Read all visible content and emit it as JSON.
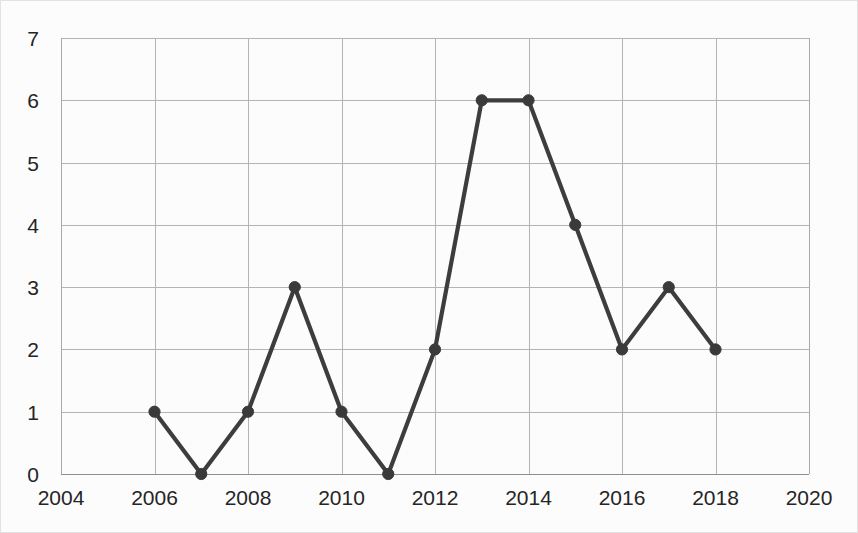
{
  "chart_data": {
    "type": "line",
    "title": "",
    "subtitle": "",
    "xlabel": "",
    "ylabel": "",
    "x": [
      2006,
      2007,
      2008,
      2009,
      2010,
      2011,
      2012,
      2013,
      2014,
      2015,
      2016,
      2017,
      2018
    ],
    "values": [
      1,
      0,
      1,
      3,
      1,
      0,
      2,
      6,
      6,
      4,
      2,
      3,
      2
    ],
    "series": [
      {
        "name": "",
        "x": [
          2006,
          2007,
          2008,
          2009,
          2010,
          2011,
          2012,
          2013,
          2014,
          2015,
          2016,
          2017,
          2018
        ],
        "values": [
          1,
          0,
          1,
          3,
          1,
          0,
          2,
          6,
          6,
          4,
          2,
          3,
          2
        ]
      }
    ],
    "xlim": [
      2004,
      2020
    ],
    "ylim": [
      0,
      7
    ],
    "x_tick_labels": [
      "2004",
      "2006",
      "2008",
      "2010",
      "2012",
      "2014",
      "2016",
      "2018",
      "2020"
    ],
    "x_tick_values": [
      2004,
      2006,
      2008,
      2010,
      2012,
      2014,
      2016,
      2018,
      2020
    ],
    "y_tick_labels": [
      "0",
      "1",
      "2",
      "3",
      "4",
      "5",
      "6",
      "7"
    ],
    "y_tick_values": [
      0,
      1,
      2,
      3,
      4,
      5,
      6,
      7
    ],
    "grid": true,
    "grid_x": true,
    "grid_y": true,
    "legend": false,
    "legend_position": "none",
    "markers": true,
    "marker_shape": "circle",
    "line_color": "#3d3d3d",
    "marker_color": "#3a3a3a",
    "grid_color": "#b4b4b4",
    "axis_color": "#8e8e8e",
    "background_color": "#fcfcfc",
    "text_color": "#252525"
  }
}
